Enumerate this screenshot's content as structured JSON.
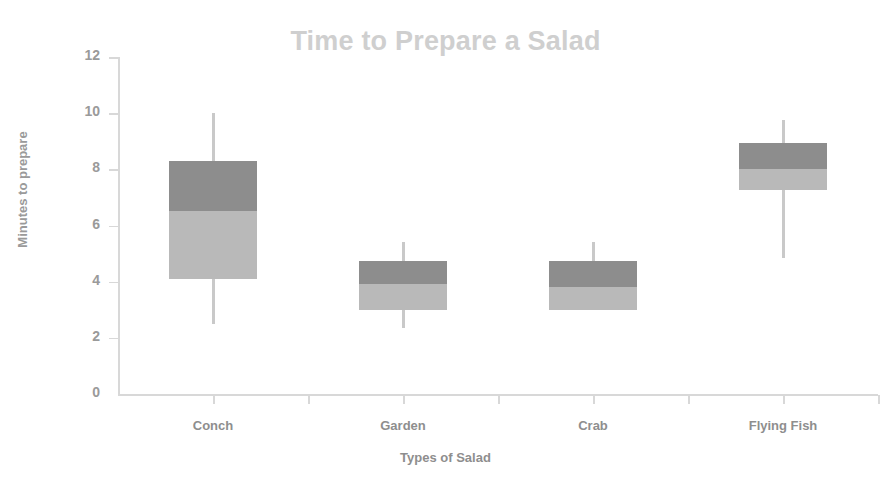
{
  "chart_data": {
    "type": "bar",
    "subtype": "box-plot",
    "title": "Time to Prepare a Salad",
    "xlabel": "Types of Salad",
    "ylabel": "Minutes to prepare",
    "categories": [
      "Conch",
      "Garden",
      "Crab",
      "Flying Fish"
    ],
    "ylim": [
      0,
      12
    ],
    "yticks": [
      0,
      2,
      4,
      6,
      8,
      10,
      12
    ],
    "ytick_labels": [
      "0",
      "2",
      "4",
      "6",
      "8",
      "10",
      "12"
    ],
    "grid": false,
    "legend": "none",
    "colors": {
      "box_upper": "#8d8d8d",
      "box_lower": "#b9b9b9",
      "whisker": "#c9c9c9",
      "axis": "#d8d8d8",
      "title_text": "#cfcfcf",
      "axis_text": "#8e8e8e"
    },
    "series": [
      {
        "name": "Conch",
        "min": 2.5,
        "q1": 4.1,
        "median": 6.5,
        "q3": 8.3,
        "max": 10.0
      },
      {
        "name": "Garden",
        "min": 2.35,
        "q1": 3.0,
        "median": 3.9,
        "q3": 4.75,
        "max": 5.4
      },
      {
        "name": "Crab",
        "min": 3.0,
        "q1": 3.0,
        "median": 3.8,
        "q3": 4.75,
        "max": 5.4
      },
      {
        "name": "Flying Fish",
        "min": 4.85,
        "q1": 7.25,
        "median": 8.0,
        "q3": 8.95,
        "max": 9.75
      }
    ]
  },
  "axes": {
    "y_axis_title": "Minutes to prepare",
    "x_axis_title": "Types of Salad"
  },
  "title": {
    "text": "Time to Prepare a Salad"
  }
}
